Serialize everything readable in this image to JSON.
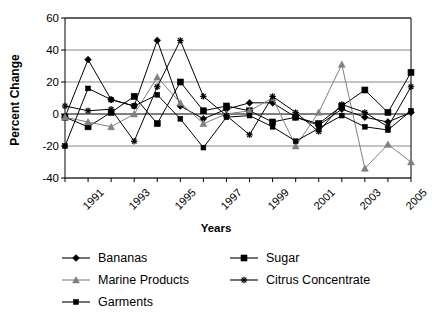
{
  "chart_data": {
    "type": "line",
    "title": "",
    "xlabel": "Years",
    "ylabel": "Percent Change",
    "xlim": [
      1991,
      2006
    ],
    "ylim": [
      -40,
      60
    ],
    "yticks": [
      60,
      40,
      20,
      0,
      -20,
      -40
    ],
    "xticks": [
      1991,
      1992,
      1993,
      1994,
      1995,
      1996,
      1997,
      1998,
      1999,
      2000,
      2001,
      2002,
      2003,
      2004,
      2005,
      2006
    ],
    "xtick_labels": [
      "1991",
      "",
      "1993",
      "",
      "1995",
      "",
      "1997",
      "",
      "1999",
      "",
      "2001",
      "",
      "2003",
      "",
      "2005",
      ""
    ],
    "grid": true,
    "grid_axis": "y",
    "legend_position": "bottom",
    "x": [
      1991,
      1992,
      1993,
      1994,
      1995,
      1996,
      1997,
      1998,
      1999,
      2000,
      2001,
      2002,
      2003,
      2004,
      2005,
      2006
    ],
    "series": [
      {
        "name": "Bananas",
        "marker": "diamond",
        "color": "#000000",
        "values": [
          -2,
          34,
          9,
          5,
          46,
          5,
          -3,
          3,
          7,
          7,
          -2,
          -7,
          3,
          -2,
          -5,
          1
        ]
      },
      {
        "name": "Sugar",
        "marker": "square",
        "color": "#000000",
        "values": [
          -2,
          -8,
          1,
          11,
          -6,
          20,
          2,
          5,
          2,
          -5,
          -2,
          -6,
          5,
          15,
          1,
          26
        ]
      },
      {
        "name": "Marine Products",
        "marker": "triangle",
        "color": "#808080",
        "values": [
          -2,
          -5,
          -8,
          0,
          23,
          7,
          -6,
          0,
          2,
          10,
          -20,
          1,
          31,
          -34,
          -19,
          -30
        ]
      },
      {
        "name": "Citrus Concentrate",
        "marker": "star",
        "color": "#000000",
        "values": [
          5,
          2,
          3,
          -17,
          17,
          46,
          11,
          -1,
          -13,
          11,
          1,
          -11,
          6,
          1,
          -8,
          17
        ]
      },
      {
        "name": "Garments",
        "marker": "square-small",
        "color": "#000000",
        "values": [
          -20,
          16,
          9,
          5,
          12,
          -3,
          -21,
          -2,
          -1,
          -8,
          -17,
          -9,
          -1,
          -8,
          -10,
          2
        ]
      }
    ]
  }
}
